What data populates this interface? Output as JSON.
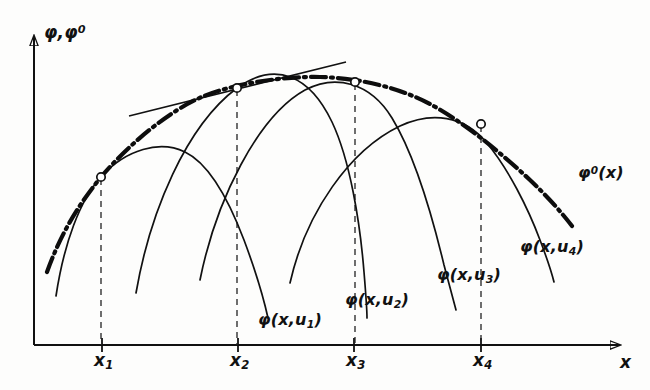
{
  "figure": {
    "type": "line-diagram",
    "axes": {
      "y_label": "φ,φ⁰",
      "x_label": "x",
      "origin": [
        34,
        345
      ],
      "x_axis_end": [
        628,
        345
      ],
      "y_axis_top": [
        34,
        28
      ]
    },
    "ticks": [
      {
        "name": "x1",
        "label": "x",
        "sub": "1",
        "x": 102,
        "label_x": 94,
        "label_y": 350
      },
      {
        "name": "x2",
        "label": "x",
        "sub": "2",
        "x": 238,
        "label_x": 230,
        "label_y": 350
      },
      {
        "name": "x3",
        "label": "x",
        "sub": "3",
        "x": 354,
        "label_x": 346,
        "label_y": 350
      },
      {
        "name": "x4",
        "label": "x",
        "sub": "4",
        "x": 481,
        "label_x": 473,
        "label_y": 350
      }
    ],
    "envelope": {
      "name": "envelope-curve",
      "label": "φ⁰(x)",
      "label_base": "φ",
      "label_sup": "0",
      "label_rest": "(x)",
      "label_x": 578,
      "label_y": 163,
      "style": "dash-dot",
      "stroke_width": 4.2,
      "color": "#0d0d0d",
      "path": "M 47,272 C 60,236 76,208 101,177 C 130,143 170,110 204,96 C 230,85 280,76 320,77 C 360,78 400,88 430,104 C 462,121 500,152 530,180 C 548,197 562,213 572,226"
    },
    "tangent_line": {
      "name": "tangent-line-at-x2",
      "color": "#111111",
      "stroke_width": 1.6,
      "x1": 129,
      "y1": 116,
      "x2": 346,
      "y2": 62
    },
    "markers": [
      {
        "name": "tangency-point-x1",
        "cx": 101,
        "cy": 177
      },
      {
        "name": "tangency-point-x2",
        "cx": 237,
        "cy": 88
      },
      {
        "name": "tangency-point-x3",
        "cx": 355,
        "cy": 82
      },
      {
        "name": "tangency-point-x4",
        "cx": 481,
        "cy": 124
      }
    ],
    "dashed_drops": [
      {
        "name": "drop-line-x1",
        "x": 101,
        "y_top": 179,
        "y_bottom": 345
      },
      {
        "name": "drop-line-x2",
        "x": 237,
        "y_top": 90,
        "y_bottom": 345
      },
      {
        "name": "drop-line-x3",
        "x": 355,
        "y_top": 84,
        "y_bottom": 345
      },
      {
        "name": "drop-line-x4",
        "x": 481,
        "y_top": 126,
        "y_bottom": 345
      }
    ],
    "family_curves": [
      {
        "name": "curve-phi-u1",
        "label_base": "φ",
        "label_rest": "(x,u",
        "label_sub": "1",
        "label_tail": ")",
        "label_x": 258,
        "label_y": 310,
        "color": "#111111",
        "stroke_width": 1.7,
        "path": "M 56,296 C 64,243 80,200 101,177 C 126,149 160,140 185,152 C 208,163 228,198 244,240 C 256,272 264,300 268,318"
      },
      {
        "name": "curve-phi-u2",
        "label_base": "φ",
        "label_rest": "(x,u",
        "label_sub": "2",
        "label_tail": ")",
        "label_x": 345,
        "label_y": 290,
        "color": "#111111",
        "stroke_width": 1.7,
        "path": "M 136,293 C 150,212 186,126 237,88 C 276,60 310,76 332,122 C 350,160 360,222 364,272 C 366,296 367,310 367,318"
      },
      {
        "name": "curve-phi-u3",
        "label_base": "φ",
        "label_rest": "(x,u",
        "label_sub": "3",
        "label_tail": ")",
        "label_x": 437,
        "label_y": 265,
        "color": "#111111",
        "stroke_width": 1.7,
        "path": "M 200,280 C 216,200 258,116 305,90 C 335,74 370,82 392,118 C 414,154 432,215 444,265 C 450,288 454,302 456,310"
      },
      {
        "name": "curve-phi-u4",
        "label_base": "φ",
        "label_rest": "(x,u",
        "label_sub": "4",
        "label_tail": ")",
        "label_x": 520,
        "label_y": 237,
        "color": "#111111",
        "stroke_width": 1.7,
        "path": "M 290,283 C 306,212 350,150 400,126 C 432,111 464,116 486,142 C 508,168 528,208 540,240 C 548,261 552,274 554,282"
      }
    ]
  }
}
